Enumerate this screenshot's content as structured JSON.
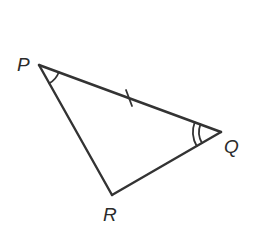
{
  "diagram": {
    "type": "triangle",
    "background": "#ffffff",
    "line_color": "#333333",
    "vertices": [
      {
        "id": "P",
        "label": "P",
        "x": 39,
        "y": 65
      },
      {
        "id": "Q",
        "label": "Q",
        "x": 221,
        "y": 132
      },
      {
        "id": "R",
        "label": "R",
        "x": 112,
        "y": 195
      }
    ],
    "sides": [
      {
        "from": "P",
        "to": "Q",
        "tick_marks": 1
      },
      {
        "from": "Q",
        "to": "R",
        "tick_marks": 0
      },
      {
        "from": "R",
        "to": "P",
        "tick_marks": 0
      }
    ],
    "angle_marks": [
      {
        "vertex": "P",
        "arcs": 1
      },
      {
        "vertex": "Q",
        "arcs": 2
      }
    ],
    "labels": {
      "p": "P",
      "q": "Q",
      "r": "R"
    }
  }
}
